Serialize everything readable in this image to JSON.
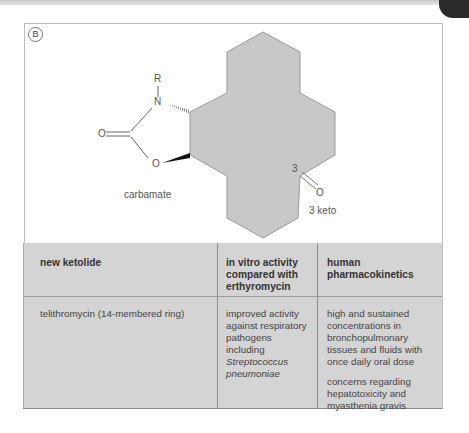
{
  "figure": {
    "panel_label": "B",
    "structure": {
      "atoms": {
        "r_group": "R",
        "nitrogen": "N",
        "carbonyl_oxygen": "O",
        "ring_oxygen": "O",
        "c3_label": "3",
        "keto_oxygen": "O"
      },
      "annotations": {
        "carbamate": "carbamate",
        "keto": "3 keto"
      },
      "colors": {
        "macrocycle_fill": "#c8c8c8",
        "macrocycle_stroke": "#9a9a9a",
        "bond": "#666666"
      }
    }
  },
  "table": {
    "headers": [
      "new ketolide",
      "in vitro activity compared with erthyromycin",
      "human pharmacokinetics"
    ],
    "header_lines": {
      "col1": [
        "new ketolide"
      ],
      "col2": [
        "in vitro activity",
        "compared with",
        "erthyromycin"
      ],
      "col3": [
        "human",
        "pharmacokinetics"
      ]
    },
    "rows": [
      {
        "ketolide": "telithromycin (14-membered ring)",
        "in_vitro_lines": [
          "improved activity",
          "against respiratory",
          "pathogens",
          "including"
        ],
        "in_vitro_italic_lines": [
          "Streptococcus",
          "pneumoniae"
        ],
        "pk_para1_lines": [
          "high and sustained",
          "concentrations in",
          "bronchopulmonary",
          "tissues and fluids with",
          "once daily oral dose"
        ],
        "pk_para2_lines": [
          "concerns regarding",
          "hepatotoxicity and",
          "myasthenia gravis"
        ]
      }
    ],
    "colors": {
      "background": "#d4d4d4",
      "divider": "#8f8f8f"
    }
  }
}
